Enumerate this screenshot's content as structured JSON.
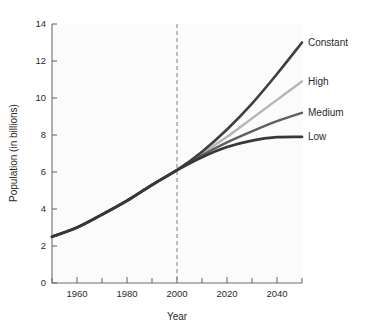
{
  "chart_data": {
    "type": "line",
    "title": "",
    "subtitle": "",
    "xlabel": "Year",
    "ylabel": "Population (in billions)",
    "xlim": [
      1950,
      2050
    ],
    "ylim": [
      0,
      14
    ],
    "grid": false,
    "legend_position": "right-inline-labels",
    "x_major_ticks": [
      1960,
      1980,
      2000,
      2020,
      2040
    ],
    "x_minor_ticks": [
      1950,
      1970,
      1990,
      2010,
      2030,
      2050
    ],
    "x_tick_labels": [
      "1960",
      "1980",
      "2000",
      "2020",
      "2040"
    ],
    "y_ticks": [
      0,
      2,
      4,
      6,
      8,
      10,
      12,
      14
    ],
    "y_tick_labels": [
      "0",
      "2",
      "4",
      "6",
      "8",
      "10",
      "12",
      "14"
    ],
    "annotations": [
      {
        "name": "year-2000-divider",
        "type": "vertical-dashed-line",
        "x": 2000,
        "label": ""
      }
    ],
    "x": [
      1950,
      1960,
      1970,
      1980,
      1990,
      2000,
      2010,
      2020,
      2030,
      2040,
      2050
    ],
    "series": [
      {
        "name": "Constant",
        "color": "#3f3f3f",
        "width": 2.6,
        "values": [
          2.5,
          3.0,
          3.7,
          4.45,
          5.3,
          6.1,
          7.1,
          8.3,
          9.7,
          11.3,
          13.0
        ]
      },
      {
        "name": "High",
        "color": "#b4b4b4",
        "width": 2.4,
        "values": [
          2.5,
          3.0,
          3.7,
          4.45,
          5.3,
          6.1,
          7.0,
          7.9,
          8.9,
          9.9,
          10.9
        ]
      },
      {
        "name": "Medium",
        "color": "#5f5f5f",
        "width": 2.4,
        "values": [
          2.5,
          3.0,
          3.7,
          4.45,
          5.3,
          6.1,
          6.9,
          7.6,
          8.2,
          8.75,
          9.2
        ]
      },
      {
        "name": "Low",
        "color": "#383838",
        "width": 2.8,
        "values": [
          2.5,
          3.0,
          3.7,
          4.45,
          5.3,
          6.1,
          6.8,
          7.35,
          7.7,
          7.88,
          7.9
        ]
      }
    ],
    "series_labels": [
      "Constant",
      "High",
      "Medium",
      "Low"
    ]
  }
}
